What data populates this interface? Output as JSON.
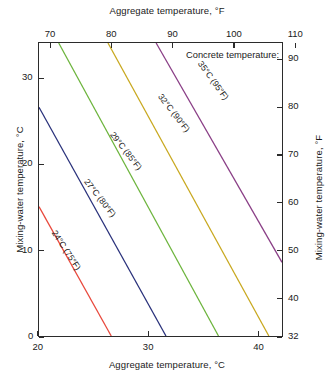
{
  "chart_data": {
    "type": "line",
    "title": "",
    "xlabel": "Aggregate temperature, °C",
    "xlabel_top": "Aggregate temperature, °F",
    "ylabel": "Mixing-water temperature, °C",
    "ylabel_right": "Mixing-water temperature, °F",
    "xlim": [
      20,
      42.2
    ],
    "ylim": [
      0,
      34.2
    ],
    "xlim_f": [
      68,
      108
    ],
    "ylim_f": [
      32,
      93.6
    ],
    "grid": false,
    "legend_position": "upper-right-inside",
    "legend_title": "Concrete temperature:",
    "xticks": [
      20,
      30,
      40
    ],
    "xticklabels": [
      "20",
      "30",
      "40"
    ],
    "xticks_top_f": [
      70,
      80,
      90,
      100,
      110
    ],
    "xticklabels_top_f": [
      "70",
      "80",
      "90",
      "100",
      "110"
    ],
    "yticks": [
      0,
      10,
      20,
      30
    ],
    "yticklabels": [
      "0",
      "10",
      "20",
      "30"
    ],
    "yticks_right_f": [
      32,
      40,
      50,
      60,
      70,
      80,
      90
    ],
    "yticklabels_right_f": [
      "32",
      "40",
      "50",
      "60",
      "70",
      "80",
      "90"
    ],
    "series": [
      {
        "name": "24 C (75 F)",
        "label": "24°C (75°F)",
        "color": "#e8483c",
        "concrete_temp_c": 24,
        "concrete_temp_f": 75,
        "x": [
          20.0,
          26.6
        ],
        "y": [
          15.1,
          0.0
        ]
      },
      {
        "name": "27 C (80 F)",
        "label": "27°C (80°F)",
        "color": "#28307a",
        "concrete_temp_c": 27,
        "concrete_temp_f": 80,
        "x": [
          20.0,
          31.6
        ],
        "y": [
          26.7,
          0.0
        ]
      },
      {
        "name": "29 C (85 F)",
        "label": "29°C (85°F)",
        "color": "#6cb43c",
        "concrete_temp_c": 29,
        "concrete_temp_f": 85,
        "x": [
          21.8,
          36.4
        ],
        "y": [
          34.2,
          0.0
        ]
      },
      {
        "name": "32 C (90 F)",
        "label": "32°C (90°F)",
        "color": "#c8a81e",
        "concrete_temp_c": 32,
        "concrete_temp_f": 90,
        "x": [
          26.3,
          41.0
        ],
        "y": [
          34.2,
          0.0
        ]
      },
      {
        "name": "35 C (95 F)",
        "label": "35°C (95°F)",
        "color": "#8a3f86",
        "concrete_temp_c": 35,
        "concrete_temp_f": 95,
        "x": [
          30.7,
          42.2
        ],
        "y": [
          34.2,
          8.6
        ]
      }
    ]
  },
  "axes": {
    "top_title": "Aggregate temperature, °F",
    "bottom_title": "Aggregate temperature, °C",
    "left_title": "Mixing-water temperature, °C",
    "right_title": "Mixing-water temperature, °F"
  },
  "legend": {
    "title": "Concrete temperature:"
  },
  "curve_labels": [
    {
      "text": "24°C (75°F)",
      "x": 54,
      "y": 226,
      "angle": 57
    },
    {
      "text": "27°C (80°F)",
      "x": 86,
      "y": 175,
      "angle": 52
    },
    {
      "text": "29°C (85°F)",
      "x": 112,
      "y": 128,
      "angle": 52
    },
    {
      "text": "32°C (90°F)",
      "x": 160,
      "y": 90,
      "angle": 52
    },
    {
      "text": "35°C (95°F)",
      "x": 200,
      "y": 57,
      "angle": 54
    }
  ]
}
